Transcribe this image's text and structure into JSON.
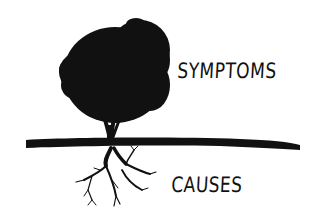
{
  "diagram": {
    "labels": {
      "above_ground": "SYMPTOMS",
      "below_ground": "CAUSES"
    },
    "elements": {
      "canopy": "tree-canopy",
      "trunk": "tree-trunk",
      "ground": "ground-line",
      "roots": "tree-roots"
    },
    "colors": {
      "ink": "#111111",
      "background": "#ffffff"
    }
  }
}
